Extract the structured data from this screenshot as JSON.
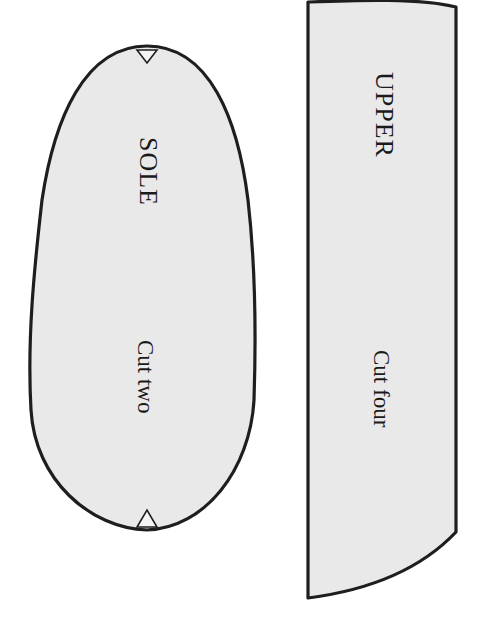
{
  "pattern": {
    "background_color": "#ffffff",
    "fill_color": "#e9e9e9",
    "outline_color": "#1e1e1e",
    "pieces": [
      {
        "id": "sole",
        "title": "SOLE",
        "instruction": "Cut two",
        "notches": [
          "top-notch",
          "bottom-notch"
        ]
      },
      {
        "id": "upper",
        "title": "UPPER",
        "instruction": "Cut four"
      }
    ]
  }
}
